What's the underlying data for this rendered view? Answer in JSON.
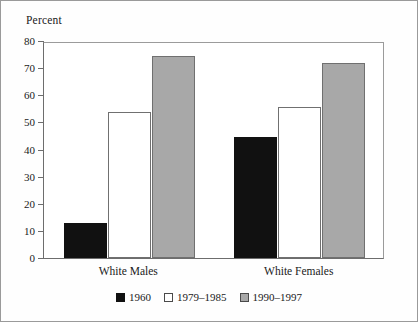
{
  "figure": {
    "axis_title": "Percent"
  },
  "chart_data": {
    "type": "bar",
    "title": "",
    "subtitle": "",
    "xlabel": "",
    "ylabel": "Percent",
    "ylim": [
      0,
      80
    ],
    "yticks": [
      0,
      10,
      20,
      30,
      40,
      50,
      60,
      70,
      80
    ],
    "ytick_labels": [
      "0",
      "10",
      "20",
      "30",
      "40",
      "50",
      "60",
      "70",
      "80"
    ],
    "grid": false,
    "legend_position": "bottom-center",
    "categories": [
      "White Males",
      "White Females"
    ],
    "series": [
      {
        "name": "1960",
        "color": "#111111",
        "values": [
          13,
          44.5
        ]
      },
      {
        "name": "1979–1985",
        "color": "#ffffff",
        "values": [
          54,
          55.5
        ]
      },
      {
        "name": "1990–1997",
        "color": "#a8a8a8",
        "values": [
          74.5,
          72
        ]
      }
    ]
  }
}
